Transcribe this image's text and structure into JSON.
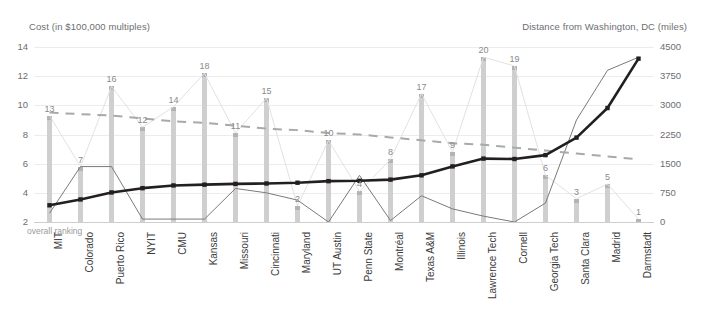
{
  "axis_titles": {
    "left": "Cost (in $100,000 multiples)",
    "right": "Distance from Washington, DC (miles)"
  },
  "note": "overall ranking",
  "colors": {
    "bar": "#cfcfcf",
    "cost_line": "#7a7a7a",
    "distance_line": "#231f20",
    "trend_line": "#a7a9ac",
    "ranking_line": "#e2e2e2",
    "grid": "#ececec",
    "text": "#6d6e71"
  },
  "chart_data": {
    "type": "bar",
    "title": "",
    "xlabel": "",
    "ylabel": "Cost (in $100,000 multiples)",
    "y2label": "Distance from Washington, DC (miles)",
    "ylim": [
      2,
      14
    ],
    "y2lim": [
      0,
      4500
    ],
    "yticks": [
      2,
      4,
      6,
      8,
      10,
      12,
      14
    ],
    "y2ticks": [
      0,
      750,
      1500,
      2250,
      3000,
      3750,
      4500
    ],
    "grid": true,
    "legend_position": "none",
    "categories": [
      "MIT",
      "Colorado",
      "Puerto Rico",
      "NYIT",
      "CMU",
      "Kansas",
      "Missouri",
      "Cincinnati",
      "Maryland",
      "UT Austin",
      "Penn State",
      "Montréal",
      "Texas A&M",
      "Illinois",
      "Lawrence Tech",
      "Cornell",
      "Georgia Tech",
      "Santa Clara",
      "Madrid",
      "Darmstadt"
    ],
    "series": [
      {
        "name": "overall ranking",
        "type": "bar",
        "axis": "left",
        "labels": [
          13,
          7,
          16,
          12,
          14,
          18,
          11,
          15,
          2,
          10,
          4,
          8,
          17,
          9,
          20,
          19,
          6,
          3,
          5,
          1
        ],
        "values": [
          9.3,
          5.8,
          11.3,
          8.5,
          9.9,
          12.2,
          8.1,
          10.5,
          3.1,
          7.6,
          4.1,
          6.3,
          10.8,
          6.8,
          13.3,
          12.7,
          5.2,
          3.6,
          4.6,
          2.2
        ]
      },
      {
        "name": "cost",
        "type": "line",
        "axis": "left",
        "values": [
          2.6,
          5.8,
          5.8,
          2.2,
          2.2,
          2.2,
          4.3,
          4.0,
          3.5,
          2.0,
          5.2,
          2.1,
          3.8,
          2.9,
          2.4,
          2.0,
          3.3,
          9.0,
          12.4,
          13.3
        ]
      },
      {
        "name": "distance",
        "type": "line",
        "axis": "right",
        "values": [
          430,
          580,
          760,
          870,
          940,
          960,
          980,
          990,
          1010,
          1050,
          1060,
          1090,
          1200,
          1430,
          1630,
          1620,
          1720,
          2170,
          2930,
          4200
        ]
      },
      {
        "name": "trend",
        "type": "dashed-line",
        "axis": "left",
        "values": [
          9.5,
          9.4,
          9.3,
          9.1,
          8.9,
          8.8,
          8.6,
          8.4,
          8.3,
          8.1,
          8.0,
          7.8,
          7.6,
          7.4,
          7.3,
          7.1,
          6.9,
          6.7,
          6.5,
          6.3
        ]
      }
    ]
  }
}
